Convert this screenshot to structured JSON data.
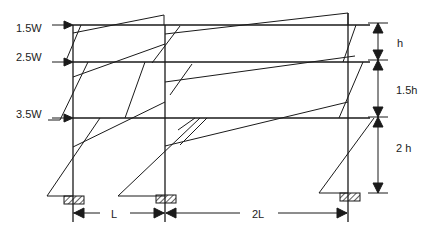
{
  "diagram": {
    "type": "portal-frame-moment-diagram",
    "stroke_color": "#1a1a1a",
    "loads": [
      {
        "label": "1.5W",
        "level": "roof"
      },
      {
        "label": "2.5W",
        "level": "floor-2"
      },
      {
        "label": "3.5W",
        "level": "floor-1"
      }
    ],
    "story_heights": [
      {
        "label": "h"
      },
      {
        "label": "1.5h"
      },
      {
        "label": "2 h"
      }
    ],
    "bay_widths": [
      {
        "label": "L"
      },
      {
        "label": "2L"
      }
    ]
  }
}
